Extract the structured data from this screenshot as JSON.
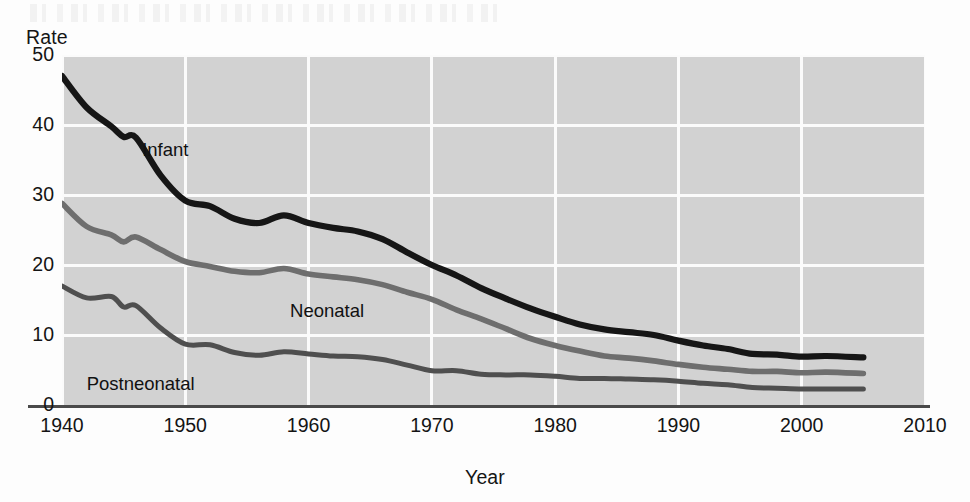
{
  "chart_data": {
    "type": "line",
    "title": "",
    "xlabel": "Year",
    "ylabel": "Rate",
    "xlim": [
      1940,
      2010
    ],
    "ylim": [
      0,
      50
    ],
    "xticks": [
      "1940",
      "1950",
      "1960",
      "1970",
      "1980",
      "1990",
      "2000",
      "2010"
    ],
    "yticks": [
      "0",
      "10",
      "20",
      "30",
      "40",
      "50"
    ],
    "grid": true,
    "legend": "inline-labels",
    "x": [
      1940,
      1942,
      1944,
      1945,
      1946,
      1948,
      1950,
      1952,
      1954,
      1956,
      1958,
      1960,
      1962,
      1964,
      1966,
      1968,
      1970,
      1972,
      1974,
      1976,
      1978,
      1980,
      1982,
      1984,
      1986,
      1988,
      1990,
      1992,
      1994,
      1996,
      1998,
      2000,
      2002,
      2005
    ],
    "series": [
      {
        "name": "Infant",
        "color": "#161616",
        "width": 6.2,
        "label_x": 1946.5,
        "label_y": 36.5,
        "values": [
          47.0,
          42.5,
          39.8,
          38.3,
          38.2,
          32.8,
          29.2,
          28.4,
          26.6,
          26.0,
          27.1,
          26.0,
          25.3,
          24.8,
          23.7,
          21.8,
          20.0,
          18.5,
          16.7,
          15.2,
          13.8,
          12.6,
          11.5,
          10.8,
          10.4,
          10.0,
          9.2,
          8.5,
          8.0,
          7.3,
          7.2,
          6.9,
          7.0,
          6.8
        ]
      },
      {
        "name": "Neonatal",
        "color": "#6e6e6e",
        "width": 5.6,
        "label_x": 1958.5,
        "label_y": 13.4,
        "values": [
          28.8,
          25.5,
          24.3,
          23.3,
          24.0,
          22.2,
          20.5,
          19.8,
          19.1,
          18.9,
          19.5,
          18.7,
          18.3,
          17.9,
          17.2,
          16.1,
          15.1,
          13.6,
          12.3,
          10.9,
          9.5,
          8.5,
          7.7,
          7.0,
          6.7,
          6.3,
          5.8,
          5.4,
          5.1,
          4.8,
          4.8,
          4.6,
          4.7,
          4.5
        ]
      },
      {
        "name": "Postneonatal",
        "color": "#4f4f4f",
        "width": 5.0,
        "label_x": 1942.0,
        "label_y": 3.0,
        "values": [
          17.0,
          15.3,
          15.5,
          14.0,
          14.2,
          11.0,
          8.7,
          8.6,
          7.5,
          7.1,
          7.6,
          7.3,
          7.0,
          6.9,
          6.5,
          5.7,
          4.9,
          4.9,
          4.4,
          4.3,
          4.3,
          4.1,
          3.8,
          3.8,
          3.7,
          3.6,
          3.4,
          3.1,
          2.9,
          2.5,
          2.4,
          2.3,
          2.3,
          2.3
        ]
      }
    ]
  },
  "colors": {
    "plot_background": "#d2d2d2",
    "gridline": "#fbfbfb",
    "axis_line": "#4a4a4a",
    "text": "#141414"
  }
}
